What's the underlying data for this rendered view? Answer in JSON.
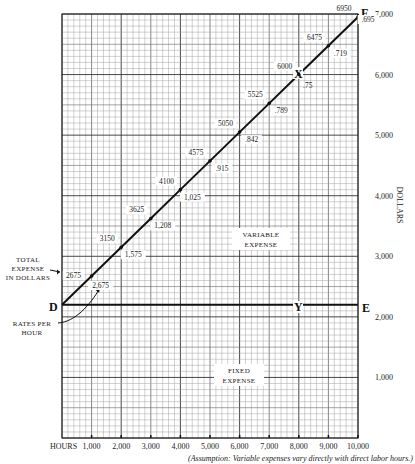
{
  "chart_data": {
    "type": "line",
    "title": "",
    "xlabel": "HOURS",
    "ylabel": "DOLLARS",
    "xlim": [
      0,
      10000
    ],
    "ylim": [
      0,
      7000
    ],
    "x_ticks": [
      1000,
      2000,
      3000,
      4000,
      5000,
      6000,
      7000,
      8000,
      9000,
      10000
    ],
    "x_tick_labels": [
      "1,000",
      "2,000",
      "3,000",
      "4,000",
      "5,000",
      "6,000",
      "7,000",
      "8,000",
      "9,000",
      "10,000"
    ],
    "y_ticks": [
      1000,
      2000,
      3000,
      4000,
      5000,
      6000,
      7000
    ],
    "y_tick_labels": [
      "1,000",
      "2,000",
      "3,000",
      "4,000",
      "5,000",
      "6,000",
      "7,000"
    ],
    "grid": true,
    "series": [
      {
        "name": "Total expense (D-F)",
        "x": [
          0,
          1000,
          2000,
          3000,
          4000,
          5000,
          6000,
          7000,
          8000,
          9000,
          10000
        ],
        "y": [
          2200,
          2675,
          3150,
          3625,
          4100,
          4575,
          5050,
          5525,
          6000,
          6475,
          6950
        ],
        "point_labels": [
          "",
          "2675",
          "3150",
          "3625",
          "4100",
          "4575",
          "5050",
          "5525",
          "6000",
          "6475",
          "6950"
        ],
        "rate_labels": [
          "",
          "2,675",
          "1,575",
          "1,208",
          "1,025",
          ".915",
          ".842",
          ".789",
          ".75",
          ".719",
          ".695"
        ]
      },
      {
        "name": "Fixed expense (D-E)",
        "x": [
          0,
          10000
        ],
        "y": [
          2200,
          2200
        ]
      }
    ],
    "point_markers": {
      "D": {
        "x": 0,
        "y": 2200
      },
      "E": {
        "x": 10000,
        "y": 2200
      },
      "F": {
        "x": 10000,
        "y": 7000
      },
      "X": {
        "x": 8000,
        "y": 6000
      },
      "Y": {
        "x": 8000,
        "y": 2200
      }
    },
    "annotations": [
      "TOTAL EXPENSE IN DOLLARS",
      "RATES PER HOUR",
      "VARIABLE EXPENSE",
      "FIXED EXPENSE",
      "(Assumption: Variable expenses vary directly with direct labor hours.)"
    ]
  },
  "labels": {
    "hours": "HOURS",
    "dollars": "DOLLARS",
    "total_expense_1": "TOTAL",
    "total_expense_2": "EXPENSE",
    "total_expense_3": "IN DOLLARS",
    "rates_1": "RATES PER",
    "rates_2": "HOUR",
    "variable_1": "VARIABLE",
    "variable_2": "EXPENSE",
    "fixed_1": "FIXED",
    "fixed_2": "EXPENSE",
    "point_D": "D",
    "point_E": "E",
    "point_F": "F",
    "point_X": "X",
    "point_Y": "Y",
    "assumption": "(Assumption: Variable expenses vary directly with direct labor hours.)"
  },
  "colors": {
    "line": "#111111",
    "grid_minor": "#9a9a9a",
    "grid_major": "#333333"
  }
}
